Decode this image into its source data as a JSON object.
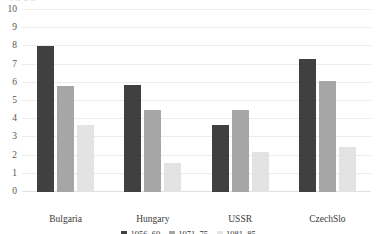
{
  "top_sliver_text": "ȼ  ɤ          ɑ                          ɑ            ɑ",
  "chart_data": {
    "type": "bar",
    "title": "",
    "subtitle": "",
    "xlabel": "",
    "ylabel": "",
    "categories": [
      "Bulgaria",
      "Hungary",
      "USSR",
      "CzechSlo"
    ],
    "series": [
      {
        "name": "1956–60",
        "color": "#404040",
        "values": [
          8.0,
          5.9,
          3.7,
          7.3
        ]
      },
      {
        "name": "1971–75",
        "color": "#a6a6a6",
        "values": [
          5.8,
          4.5,
          4.5,
          6.1
        ]
      },
      {
        "name": "1981–85",
        "color": "#e3e3e3",
        "values": [
          3.7,
          1.6,
          2.2,
          2.5
        ]
      }
    ],
    "ylim": [
      0,
      10
    ],
    "ytick_values": [
      0,
      1,
      2,
      3,
      4,
      5,
      6,
      7,
      8,
      9,
      10
    ],
    "ytick_labels": [
      "0",
      "1",
      "2",
      "3",
      "4",
      "5",
      "6",
      "7",
      "8",
      "9",
      "10"
    ],
    "grid": true,
    "grid_color": "#ececec",
    "legend_position": "bottom",
    "bar_group_order": [
      "1956–60",
      "1971–75",
      "1981–85"
    ]
  }
}
